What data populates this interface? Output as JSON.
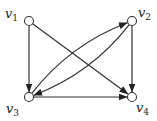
{
  "diagram": {
    "type": "directed-graph",
    "width": 157,
    "height": 121,
    "stroke_color": "#333333",
    "node_fill": "#ffffff",
    "node_radius": 4.5,
    "nodes": [
      {
        "id": "v1",
        "base": "v",
        "sub": "1",
        "x": 29,
        "y": 21,
        "label_x": 5,
        "label_y": 18
      },
      {
        "id": "v2",
        "base": "v",
        "sub": "2",
        "x": 132,
        "y": 21,
        "label_x": 138,
        "label_y": 17
      },
      {
        "id": "v3",
        "base": "v",
        "sub": "3",
        "x": 29,
        "y": 97,
        "label_x": 6,
        "label_y": 113
      },
      {
        "id": "v4",
        "base": "v",
        "sub": "4",
        "x": 132,
        "y": 97,
        "label_x": 136,
        "label_y": 112
      }
    ],
    "edges": [
      {
        "from": "v1",
        "to": "v3",
        "curve": 0
      },
      {
        "from": "v1",
        "to": "v4",
        "curve": 0
      },
      {
        "from": "v3",
        "to": "v4",
        "curve": 0
      },
      {
        "from": "v2",
        "to": "v4",
        "curve": 0
      },
      {
        "from": "v3",
        "to": "v2",
        "curve": -18
      },
      {
        "from": "v2",
        "to": "v3",
        "curve": -18
      }
    ]
  }
}
